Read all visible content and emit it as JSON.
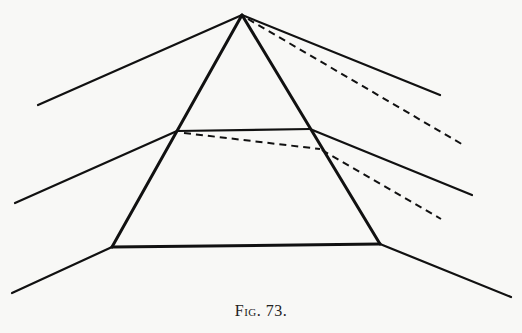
{
  "figure": {
    "caption": "Fig. 73.",
    "background": "#f8f8f6",
    "ink": "#111111",
    "prism_top": {
      "apex": [
        242,
        15
      ],
      "left_base": [
        177,
        131
      ],
      "right_base": [
        310,
        129
      ]
    },
    "prism_bottom": {
      "top_left": [
        177,
        131
      ],
      "top_right": [
        310,
        129
      ],
      "bottom_left": [
        112,
        247
      ],
      "bottom_right": [
        380,
        244
      ]
    },
    "rays": {
      "upper_incident": {
        "from": [
          38,
          105
        ],
        "to": [
          242,
          15
        ]
      },
      "upper_emergent": {
        "from": [
          242,
          15
        ],
        "to": [
          440,
          95
        ]
      },
      "upper_dashed": {
        "from": [
          246,
          19
        ],
        "to": [
          465,
          146
        ]
      },
      "middle_incident": {
        "from": [
          15,
          203
        ],
        "to": [
          177,
          131
        ]
      },
      "middle_emergent": {
        "from": [
          310,
          129
        ],
        "to": [
          472,
          195
        ]
      },
      "middle_dashed_inside": {
        "from": [
          183,
          133
        ],
        "to": [
          320,
          149
        ]
      },
      "middle_dashed_outside": {
        "from": [
          320,
          149
        ],
        "to": [
          441,
          219
        ]
      },
      "lower_incident": {
        "from": [
          12,
          293
        ],
        "to": [
          112,
          247
        ]
      },
      "lower_emergent": {
        "from": [
          380,
          244
        ],
        "to": [
          511,
          297
        ]
      }
    }
  }
}
